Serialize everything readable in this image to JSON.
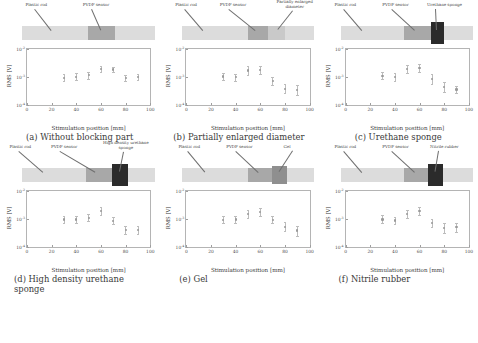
{
  "figure": {
    "axis": {
      "xlabel": "Stimulation position [mm]",
      "ylabel": "RMS [V]",
      "xticks": [
        "0",
        "20",
        "40",
        "60",
        "80",
        "100"
      ],
      "yticks": [
        "10",
        "10",
        "10"
      ],
      "yexp": [
        "-2",
        "-3",
        "-4"
      ]
    },
    "labels": {
      "plastic_rod": "Plastic rod",
      "pvdf_sensor": "PVDF sensor",
      "partially_enlarged": "Partially enlarged diameter",
      "urethane_sponge": "Urethane sponge",
      "high_density": "High density urethane sponge",
      "gel": "Gel",
      "nitrile_rubber": "Nitrile rubber"
    },
    "captions": {
      "a": "(a) Without blocking part",
      "b": "(b) Partially enlarged diameter",
      "c": "(c) Urethane sponge",
      "d": "(d) High density urethane sponge",
      "e": "(e) Gel",
      "f": "(f) Nitrile rubber"
    },
    "colors": {
      "rod": "#dcdcdc",
      "sensor": "#a8a8a8",
      "block_dark": "#2b2b2b",
      "block_mid": "#8f8f8f",
      "block_light": "#c9c9c9",
      "marker": "#9a9a9a",
      "errorbar": "#bcbcbc"
    }
  },
  "chart_data": [
    {
      "id": "a",
      "type": "scatter",
      "title": "(a) Without blocking part",
      "xlabel": "Stimulation position [mm]",
      "ylabel": "RMS [V]",
      "xlim": [
        0,
        100
      ],
      "ylim": [
        0.0001,
        0.01
      ],
      "yscale": "log",
      "grid": false,
      "x": [
        30,
        40,
        50,
        60,
        70,
        80,
        90
      ],
      "y": [
        0.00095,
        0.001,
        0.00115,
        0.0019,
        0.00185,
        0.0009,
        0.001
      ],
      "yerr_low": [
        0.0007,
        0.00075,
        0.00085,
        0.0015,
        0.00145,
        0.00072,
        0.0008
      ],
      "yerr_high": [
        0.0013,
        0.00135,
        0.00155,
        0.0024,
        0.00235,
        0.00115,
        0.00125
      ],
      "schematic_blocks": [
        {
          "name": "PVDF sensor",
          "start": 50,
          "end": 70,
          "shade": "sensor"
        }
      ]
    },
    {
      "id": "b",
      "type": "scatter",
      "title": "(b) Partially enlarged diameter",
      "xlabel": "Stimulation position [mm]",
      "ylabel": "RMS [V]",
      "xlim": [
        0,
        100
      ],
      "ylim": [
        0.0001,
        0.01
      ],
      "yscale": "log",
      "grid": false,
      "x": [
        30,
        40,
        50,
        60,
        70,
        80,
        90
      ],
      "y": [
        0.00105,
        0.00098,
        0.0017,
        0.00175,
        0.00072,
        0.00038,
        0.00034
      ],
      "yerr_low": [
        0.00078,
        0.00072,
        0.0012,
        0.00125,
        0.0005,
        0.00026,
        0.00022
      ],
      "yerr_high": [
        0.0014,
        0.00132,
        0.0025,
        0.00255,
        0.001,
        0.00056,
        0.0005
      ],
      "schematic_blocks": [
        {
          "name": "PVDF sensor",
          "start": 50,
          "end": 65,
          "shade": "sensor"
        },
        {
          "name": "Partially enlarged diameter",
          "start": 65,
          "end": 78,
          "shade": "light"
        }
      ]
    },
    {
      "id": "c",
      "type": "scatter",
      "title": "(c) Urethane sponge",
      "xlabel": "Stimulation position [mm]",
      "ylabel": "RMS [V]",
      "xlim": [
        0,
        100
      ],
      "ylim": [
        0.0001,
        0.01
      ],
      "yscale": "log",
      "grid": false,
      "x": [
        30,
        40,
        50,
        60,
        70,
        80,
        90
      ],
      "y": [
        0.0011,
        0.001,
        0.0019,
        0.00205,
        0.00085,
        0.00044,
        0.00036
      ],
      "yerr_low": [
        0.00082,
        0.0007,
        0.00135,
        0.00145,
        0.00058,
        0.0003,
        0.00027
      ],
      "yerr_high": [
        0.0015,
        0.0014,
        0.0027,
        0.0029,
        0.00125,
        0.00064,
        0.00048
      ],
      "schematic_blocks": [
        {
          "name": "PVDF sensor",
          "start": 48,
          "end": 68,
          "shade": "sensor"
        },
        {
          "name": "Urethane sponge",
          "start": 68,
          "end": 78,
          "shade": "dark"
        }
      ]
    },
    {
      "id": "d",
      "type": "scatter",
      "title": "(d) High density urethane sponge",
      "xlabel": "Stimulation position [mm]",
      "ylabel": "RMS [V]",
      "xlim": [
        0,
        100
      ],
      "ylim": [
        0.0001,
        0.01
      ],
      "yscale": "log",
      "grid": false,
      "x": [
        30,
        40,
        50,
        60,
        70,
        80,
        90
      ],
      "y": [
        0.001,
        0.001,
        0.00115,
        0.00195,
        0.0009,
        0.00042,
        0.00042
      ],
      "yerr_low": [
        0.00075,
        0.00076,
        0.00085,
        0.0014,
        0.00066,
        0.00029,
        0.00029
      ],
      "yerr_high": [
        0.00135,
        0.00132,
        0.00155,
        0.0027,
        0.00122,
        0.0006,
        0.0006
      ],
      "schematic_blocks": [
        {
          "name": "PVDF sensor",
          "start": 48,
          "end": 68,
          "shade": "sensor"
        },
        {
          "name": "High density urethane sponge",
          "start": 68,
          "end": 80,
          "shade": "dark"
        }
      ]
    },
    {
      "id": "e",
      "type": "scatter",
      "title": "(e) Gel",
      "xlabel": "Stimulation position [mm]",
      "ylabel": "RMS [V]",
      "xlim": [
        0,
        100
      ],
      "ylim": [
        0.0001,
        0.01
      ],
      "yscale": "log",
      "grid": false,
      "x": [
        30,
        40,
        50,
        60,
        70,
        80,
        90
      ],
      "y": [
        0.00098,
        0.001,
        0.00155,
        0.00185,
        0.00098,
        0.00055,
        0.0004
      ],
      "yerr_low": [
        0.00072,
        0.00074,
        0.00112,
        0.00132,
        0.00072,
        0.00038,
        0.00026
      ],
      "yerr_high": [
        0.00132,
        0.00134,
        0.00215,
        0.0026,
        0.00133,
        0.0008,
        0.0006
      ],
      "schematic_blocks": [
        {
          "name": "PVDF sensor",
          "start": 50,
          "end": 68,
          "shade": "sensor"
        },
        {
          "name": "Gel",
          "start": 68,
          "end": 80,
          "shade": "mid"
        }
      ]
    },
    {
      "id": "f",
      "type": "scatter",
      "title": "(f) Nitrile rubber",
      "xlabel": "Stimulation position [mm]",
      "ylabel": "RMS [V]",
      "xlim": [
        0,
        100
      ],
      "ylim": [
        0.0001,
        0.01
      ],
      "yscale": "log",
      "grid": false,
      "x": [
        30,
        40,
        50,
        60,
        70,
        80,
        90
      ],
      "y": [
        0.001,
        0.00092,
        0.0016,
        0.00195,
        0.00072,
        0.0005,
        0.00052
      ],
      "yerr_low": [
        0.00072,
        0.0007,
        0.00115,
        0.0014,
        0.00052,
        0.00034,
        0.00036
      ],
      "yerr_high": [
        0.00138,
        0.00125,
        0.00225,
        0.00275,
        0.001,
        0.00072,
        0.00075
      ],
      "schematic_blocks": [
        {
          "name": "PVDF sensor",
          "start": 48,
          "end": 66,
          "shade": "sensor"
        },
        {
          "name": "Nitrile rubber",
          "start": 66,
          "end": 77,
          "shade": "dark"
        }
      ]
    }
  ]
}
